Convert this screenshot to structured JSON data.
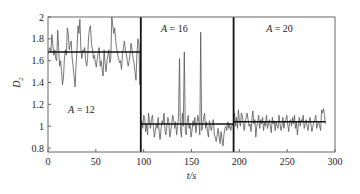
{
  "chart_data": {
    "type": "line",
    "title": "",
    "xlabel": "t/s",
    "ylabel": "D2",
    "ylabel_main": "D",
    "ylabel_sub": "2",
    "xlim": [
      0,
      300
    ],
    "ylim": [
      0.75,
      2.02
    ],
    "x_ticks": [
      0,
      50,
      100,
      150,
      200,
      250,
      300
    ],
    "y_ticks": [
      0.8,
      1,
      1.2,
      1.4,
      1.6,
      1.8,
      2
    ],
    "y_tick_labels": [
      "0.8",
      "1",
      "1.2",
      "1.4",
      "1.6",
      "1.8",
      "2"
    ],
    "x_tick_labels": [
      "0",
      "50",
      "100",
      "150",
      "200",
      "250",
      "300"
    ],
    "grid": false,
    "segment_boundaries": [
      97,
      194
    ],
    "segments": [
      {
        "name": "A = 12",
        "label": "A = 12",
        "x_range": [
          0,
          97
        ],
        "mean": 1.68,
        "label_pos": [
          35,
          1.12
        ],
        "values": [
          1.66,
          1.7,
          1.72,
          1.68,
          1.84,
          1.75,
          1.65,
          1.7,
          1.62,
          1.6,
          1.88,
          1.72,
          1.55,
          1.6,
          1.5,
          1.38,
          1.45,
          1.62,
          1.7,
          1.65,
          1.9,
          1.85,
          1.7,
          1.75,
          1.78,
          1.62,
          1.55,
          1.45,
          1.36,
          1.55,
          1.7,
          1.92,
          1.85,
          1.98,
          1.7,
          1.62,
          1.7,
          1.68,
          1.72,
          1.6,
          1.55,
          1.62,
          1.82,
          1.9,
          1.92,
          1.75,
          1.7,
          1.62,
          1.65,
          1.58,
          1.54,
          1.62,
          1.68,
          1.72,
          1.55,
          1.6,
          1.52,
          1.46,
          1.7,
          1.58,
          1.5,
          1.6,
          1.65,
          1.7,
          1.58,
          1.62,
          2.0,
          1.92,
          1.85,
          1.9,
          1.78,
          1.72,
          1.66,
          1.62,
          1.58,
          1.6,
          1.52,
          1.65,
          1.72,
          1.78,
          1.7,
          1.66,
          1.6,
          1.55,
          1.6,
          1.68,
          1.76,
          1.7,
          1.62,
          1.58,
          1.5,
          1.42,
          1.66,
          1.8,
          1.75,
          1.38,
          1.98
        ]
      },
      {
        "name": "A = 16",
        "label": "A = 16",
        "x_range": [
          97,
          194
        ],
        "mean": 1.02,
        "label_pos": [
          132,
          1.86
        ],
        "values": [
          1.0,
          1.05,
          0.98,
          1.1,
          1.08,
          0.95,
          1.02,
          0.92,
          1.12,
          1.05,
          0.98,
          1.06,
          1.1,
          1.0,
          0.9,
          0.95,
          1.02,
          0.98,
          1.08,
          0.94,
          0.88,
          0.98,
          1.05,
          1.02,
          1.12,
          0.96,
          0.92,
          1.0,
          1.08,
          1.04,
          0.9,
          0.95,
          1.02,
          1.1,
          1.06,
          0.98,
          1.04,
          0.92,
          1.0,
          1.08,
          1.62,
          0.98,
          0.9,
          1.12,
          1.0,
          1.68,
          0.96,
          0.92,
          1.04,
          1.1,
          0.98,
          1.02,
          0.9,
          0.96,
          1.05,
          1.0,
          1.08,
          0.94,
          1.02,
          1.1,
          1.04,
          0.92,
          1.86,
          0.96,
          1.0,
          1.08,
          1.12,
          0.98,
          1.04,
          0.95,
          0.9,
          1.05,
          1.0,
          0.96,
          1.02,
          1.06,
          0.92,
          0.9,
          0.86,
          0.92,
          0.98,
          0.9,
          0.84,
          0.95,
          0.88,
          0.82,
          0.92,
          0.98,
          1.0,
          0.96,
          1.04,
          0.98,
          1.02,
          0.96,
          1.0,
          1.02,
          1.0
        ]
      },
      {
        "name": "A = 20",
        "label": "A = 20",
        "x_range": [
          194,
          290
        ],
        "mean": 1.04,
        "label_pos": [
          242,
          1.86
        ],
        "values": [
          1.02,
          1.12,
          1.0,
          1.08,
          0.98,
          1.15,
          1.05,
          1.0,
          1.12,
          1.1,
          1.02,
          0.96,
          1.04,
          1.08,
          1.12,
          1.06,
          1.0,
          1.02,
          0.95,
          1.08,
          1.14,
          1.02,
          1.06,
          0.9,
          1.0,
          1.04,
          1.1,
          0.98,
          1.06,
          1.02,
          1.08,
          0.96,
          1.04,
          1.0,
          1.1,
          0.98,
          1.02,
          1.06,
          1.0,
          0.94,
          1.08,
          1.02,
          1.05,
          0.96,
          1.04,
          1.0,
          0.98,
          1.1,
          1.02,
          0.96,
          1.0,
          1.08,
          0.98,
          1.04,
          1.06,
          1.1,
          1.02,
          0.95,
          1.04,
          1.06,
          1.0,
          1.08,
          1.02,
          1.1,
          0.98,
          1.04,
          0.92,
          1.02,
          1.08,
          1.0,
          1.06,
          1.04,
          1.1,
          0.98,
          1.02,
          1.06,
          1.0,
          0.96,
          1.04,
          1.08,
          1.02,
          0.95,
          1.0,
          1.04,
          1.06,
          1.1,
          0.98,
          1.02,
          1.04,
          1.0,
          0.96,
          1.15,
          1.12,
          1.16,
          1.1,
          1.02
        ]
      }
    ]
  }
}
